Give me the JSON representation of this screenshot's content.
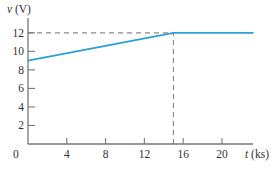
{
  "figure": {
    "background": "#ffffff"
  },
  "chart_data": {
    "type": "line",
    "title": "",
    "xlabel": "t (ks)",
    "xlabel_var": "t",
    "xlabel_unit": " (ks)",
    "ylabel": "v (V)",
    "ylabel_var": "v",
    "ylabel_unit": " (V)",
    "origin_label": "0",
    "x_ticks": [
      4,
      8,
      12,
      16,
      20
    ],
    "y_ticks": [
      2,
      4,
      6,
      8,
      10,
      12
    ],
    "xlim": [
      0,
      23.2
    ],
    "ylim": [
      0,
      13.6
    ],
    "grid": false,
    "legend": false,
    "series": [
      {
        "name": "voltage-curve",
        "color": "#2E9FD3",
        "points": [
          [
            0,
            9
          ],
          [
            15,
            12
          ],
          [
            23.2,
            12
          ]
        ]
      }
    ],
    "guides": [
      {
        "orientation": "horizontal",
        "v": 12,
        "t_start": 0,
        "t_end": 15
      },
      {
        "orientation": "vertical",
        "t": 15,
        "v_start": 0,
        "v_end": 12
      }
    ],
    "colors": {
      "series": "#2E9FD3",
      "guide": "#8A8A8A",
      "axis": "#777777",
      "text": "#333333"
    }
  }
}
